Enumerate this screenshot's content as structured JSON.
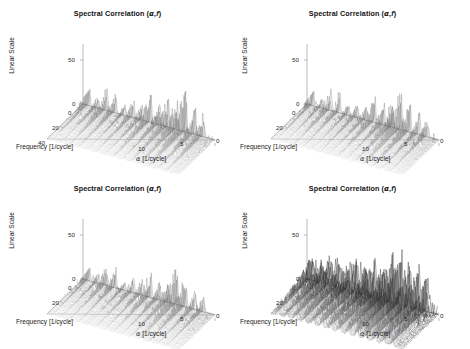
{
  "figure": {
    "background": "#ffffff",
    "panel_count": 4,
    "layout": "2x2 grid"
  },
  "panels": [
    {
      "id": "top-left",
      "title_prefix": "Spectral Correlation (",
      "title_alpha": "α",
      "title_comma": ",",
      "title_f": "f",
      "title_suffix": ")",
      "zlabel": "Linear Scale",
      "zticks": [
        "50",
        "0"
      ],
      "depth_label": "Frequency [1/cycle]",
      "depth_ticks": [
        "0",
        "20",
        "40"
      ],
      "x_label_alpha": "α",
      "x_label_rest": " [1/cycle]",
      "xticks": [
        "10",
        "5",
        "0"
      ]
    },
    {
      "id": "top-right",
      "title_prefix": "Spectral Correlation (",
      "title_alpha": "α",
      "title_comma": ",",
      "title_f": "f",
      "title_suffix": ")",
      "zlabel": "Linear Scale",
      "zticks": [
        "50",
        "0"
      ],
      "depth_label": "Frequency [1/cycle]",
      "depth_ticks": [
        "0",
        "20"
      ],
      "x_label_alpha": "α",
      "x_label_rest": " [1/cycle]",
      "xticks": [
        "10",
        "5",
        "0"
      ]
    },
    {
      "id": "bottom-left",
      "title_prefix": "Spectral Correlation (",
      "title_alpha": "α",
      "title_comma": ",",
      "title_f": "f",
      "title_suffix": ")",
      "zlabel": "Linear Scale",
      "zticks": [
        "50",
        "0"
      ],
      "depth_label": "Frequency [1/cycle]",
      "depth_ticks": [
        "0",
        "20"
      ],
      "x_label_alpha": "α",
      "x_label_rest": " [1/cycle]",
      "xticks": [
        "10",
        "5",
        "0"
      ]
    },
    {
      "id": "bottom-right",
      "title_prefix": "Spectral Correlation (",
      "title_alpha": "α",
      "title_comma": ",",
      "title_f": "f",
      "title_suffix": ")",
      "zlabel": "Linear Scale",
      "zticks": [
        "50",
        "0"
      ],
      "depth_label": "Frequency [1/cycle]",
      "depth_ticks": [
        "0",
        "20"
      ],
      "x_label_alpha": "α",
      "x_label_rest": " [1/cycle]",
      "xticks": [
        "10",
        "5",
        "0"
      ]
    }
  ],
  "chart_data": [
    {
      "type": "line",
      "title": "Spectral Correlation (α,f)",
      "panel": "top-left",
      "render": "3d-waterfall-mesh",
      "xlabel": "α [1/cycle]",
      "ylabel": "Frequency [1/cycle]",
      "zlabel": "Linear Scale",
      "xlim": [
        0,
        12
      ],
      "ylim": [
        0,
        40
      ],
      "zlim": [
        0,
        70
      ],
      "xticks": [
        10,
        5,
        0
      ],
      "yticks": [
        0,
        20,
        40
      ],
      "zticks": [
        0,
        50
      ],
      "x_axis_direction": "reversed",
      "grid": false,
      "legend": null,
      "colormap": "grayscale",
      "n_traces": 40,
      "spike_density": "moderate",
      "peak_value": 62,
      "description": "Sparse ridges of narrow cyclic-frequency spikes; tallest peaks clustered near alpha = 4-6 and alpha = 9-11 at low frequency.",
      "series": [
        {
          "name": "alpha-ridge-1",
          "alpha": 11.4,
          "peak": 30
        },
        {
          "name": "alpha-ridge-2",
          "alpha": 10.6,
          "peak": 24
        },
        {
          "name": "alpha-ridge-3",
          "alpha": 9.8,
          "peak": 36
        },
        {
          "name": "alpha-ridge-4",
          "alpha": 9.0,
          "peak": 27
        },
        {
          "name": "alpha-ridge-5",
          "alpha": 8.2,
          "peak": 19
        },
        {
          "name": "alpha-ridge-6",
          "alpha": 7.4,
          "peak": 33
        },
        {
          "name": "alpha-ridge-7",
          "alpha": 6.6,
          "peak": 22
        },
        {
          "name": "alpha-ridge-8",
          "alpha": 5.8,
          "peak": 41
        },
        {
          "name": "alpha-ridge-9",
          "alpha": 5.0,
          "peak": 35
        },
        {
          "name": "alpha-ridge-10",
          "alpha": 4.2,
          "peak": 52
        },
        {
          "name": "alpha-ridge-11",
          "alpha": 3.4,
          "peak": 44
        },
        {
          "name": "alpha-ridge-12",
          "alpha": 2.6,
          "peak": 62
        },
        {
          "name": "alpha-ridge-13",
          "alpha": 1.8,
          "peak": 48
        },
        {
          "name": "alpha-ridge-14",
          "alpha": 1.0,
          "peak": 38
        }
      ]
    },
    {
      "type": "line",
      "title": "Spectral Correlation (α,f)",
      "panel": "top-right",
      "render": "3d-waterfall-mesh",
      "xlabel": "α [1/cycle]",
      "ylabel": "Frequency [1/cycle]",
      "zlabel": "Linear Scale",
      "xlim": [
        0,
        12
      ],
      "ylim": [
        0,
        40
      ],
      "zlim": [
        0,
        70
      ],
      "xticks": [
        10,
        5,
        0
      ],
      "yticks": [
        0,
        20
      ],
      "zticks": [
        0,
        50
      ],
      "x_axis_direction": "reversed",
      "grid": false,
      "legend": null,
      "colormap": "grayscale",
      "n_traces": 40,
      "spike_density": "moderate",
      "peak_value": 58,
      "description": "Similar sparse ridge structure to top-left, slightly lower overall amplitude with dominant cluster near alpha = 3-5.",
      "series": [
        {
          "name": "alpha-ridge-1",
          "alpha": 11.4,
          "peak": 26
        },
        {
          "name": "alpha-ridge-2",
          "alpha": 10.6,
          "peak": 21
        },
        {
          "name": "alpha-ridge-3",
          "alpha": 9.8,
          "peak": 31
        },
        {
          "name": "alpha-ridge-4",
          "alpha": 9.0,
          "peak": 24
        },
        {
          "name": "alpha-ridge-5",
          "alpha": 8.2,
          "peak": 18
        },
        {
          "name": "alpha-ridge-6",
          "alpha": 7.4,
          "peak": 29
        },
        {
          "name": "alpha-ridge-7",
          "alpha": 6.6,
          "peak": 20
        },
        {
          "name": "alpha-ridge-8",
          "alpha": 5.8,
          "peak": 37
        },
        {
          "name": "alpha-ridge-9",
          "alpha": 5.0,
          "peak": 32
        },
        {
          "name": "alpha-ridge-10",
          "alpha": 4.2,
          "peak": 47
        },
        {
          "name": "alpha-ridge-11",
          "alpha": 3.4,
          "peak": 58
        },
        {
          "name": "alpha-ridge-12",
          "alpha": 2.6,
          "peak": 43
        },
        {
          "name": "alpha-ridge-13",
          "alpha": 1.8,
          "peak": 36
        },
        {
          "name": "alpha-ridge-14",
          "alpha": 1.0,
          "peak": 28
        }
      ]
    },
    {
      "type": "line",
      "title": "Spectral Correlation (α,f)",
      "panel": "bottom-left",
      "render": "3d-waterfall-mesh",
      "xlabel": "α [1/cycle]",
      "ylabel": "Frequency [1/cycle]",
      "zlabel": "Linear Scale",
      "xlim": [
        0,
        12
      ],
      "ylim": [
        0,
        40
      ],
      "zlim": [
        0,
        70
      ],
      "xticks": [
        10,
        5,
        0
      ],
      "yticks": [
        0,
        20
      ],
      "zticks": [
        0,
        50
      ],
      "x_axis_direction": "reversed",
      "grid": false,
      "legend": null,
      "colormap": "grayscale",
      "n_traces": 40,
      "spike_density": "moderate",
      "peak_value": 55,
      "description": "Sparse spiky ridges, tallest group near alpha = 2-4 reaching about 55 linear units.",
      "series": [
        {
          "name": "alpha-ridge-1",
          "alpha": 11.4,
          "peak": 23
        },
        {
          "name": "alpha-ridge-2",
          "alpha": 10.6,
          "peak": 19
        },
        {
          "name": "alpha-ridge-3",
          "alpha": 9.8,
          "peak": 29
        },
        {
          "name": "alpha-ridge-4",
          "alpha": 9.0,
          "peak": 25
        },
        {
          "name": "alpha-ridge-5",
          "alpha": 8.2,
          "peak": 17
        },
        {
          "name": "alpha-ridge-6",
          "alpha": 7.4,
          "peak": 31
        },
        {
          "name": "alpha-ridge-7",
          "alpha": 6.6,
          "peak": 22
        },
        {
          "name": "alpha-ridge-8",
          "alpha": 5.8,
          "peak": 34
        },
        {
          "name": "alpha-ridge-9",
          "alpha": 5.0,
          "peak": 30
        },
        {
          "name": "alpha-ridge-10",
          "alpha": 4.2,
          "peak": 42
        },
        {
          "name": "alpha-ridge-11",
          "alpha": 3.4,
          "peak": 55
        },
        {
          "name": "alpha-ridge-12",
          "alpha": 2.6,
          "peak": 46
        },
        {
          "name": "alpha-ridge-13",
          "alpha": 1.8,
          "peak": 33
        },
        {
          "name": "alpha-ridge-14",
          "alpha": 1.0,
          "peak": 26
        }
      ]
    },
    {
      "type": "line",
      "title": "Spectral Correlation (α,f)",
      "panel": "bottom-right",
      "render": "3d-waterfall-mesh",
      "xlabel": "α [1/cycle]",
      "ylabel": "Frequency [1/cycle]",
      "zlabel": "Linear Scale",
      "xlim": [
        0,
        12
      ],
      "ylim": [
        0,
        40
      ],
      "zlim": [
        0,
        70
      ],
      "xticks": [
        10,
        5,
        0
      ],
      "yticks": [
        0,
        20
      ],
      "zticks": [
        0,
        50
      ],
      "x_axis_direction": "reversed",
      "grid": false,
      "legend": null,
      "colormap": "grayscale",
      "n_traces": 40,
      "spike_density": "high",
      "peak_value": 70,
      "description": "Much denser and darker spike field than the other three panels; broadband noise floor is elevated and several spikes exceed 50, with the tallest near alpha = 3-4 exceeding the 50 tick.",
      "series": [
        {
          "name": "alpha-ridge-1",
          "alpha": 11.4,
          "peak": 38
        },
        {
          "name": "alpha-ridge-2",
          "alpha": 10.6,
          "peak": 34
        },
        {
          "name": "alpha-ridge-3",
          "alpha": 9.8,
          "peak": 44
        },
        {
          "name": "alpha-ridge-4",
          "alpha": 9.0,
          "peak": 40
        },
        {
          "name": "alpha-ridge-5",
          "alpha": 8.2,
          "peak": 36
        },
        {
          "name": "alpha-ridge-6",
          "alpha": 7.4,
          "peak": 48
        },
        {
          "name": "alpha-ridge-7",
          "alpha": 6.6,
          "peak": 42
        },
        {
          "name": "alpha-ridge-8",
          "alpha": 5.8,
          "peak": 52
        },
        {
          "name": "alpha-ridge-9",
          "alpha": 5.0,
          "peak": 49
        },
        {
          "name": "alpha-ridge-10",
          "alpha": 4.2,
          "peak": 61
        },
        {
          "name": "alpha-ridge-11",
          "alpha": 3.4,
          "peak": 70
        },
        {
          "name": "alpha-ridge-12",
          "alpha": 2.6,
          "peak": 64
        },
        {
          "name": "alpha-ridge-13",
          "alpha": 1.8,
          "peak": 53
        },
        {
          "name": "alpha-ridge-14",
          "alpha": 1.0,
          "peak": 45
        }
      ]
    }
  ]
}
